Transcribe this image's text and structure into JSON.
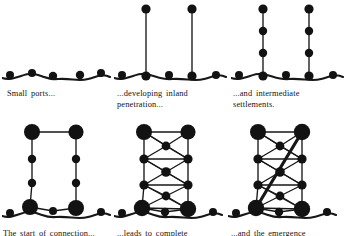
{
  "figure": {
    "stroke_color": "#171717",
    "node_color": "#121212",
    "background": "#ffffff"
  },
  "panels": [
    {
      "id": "panel-1",
      "stage": 1,
      "caption": "Small  ports...",
      "description": "scattered coastal ports along a wavy coastline",
      "nodes": [
        {
          "x": 8,
          "y": 19,
          "r": 4.0,
          "kind": "port"
        },
        {
          "x": 30,
          "y": 17,
          "r": 4.0,
          "kind": "port"
        },
        {
          "x": 51,
          "y": 20,
          "r": 4.2,
          "kind": "port"
        },
        {
          "x": 78,
          "y": 19,
          "r": 4.2,
          "kind": "port"
        },
        {
          "x": 99,
          "y": 17,
          "r": 4.0,
          "kind": "port"
        }
      ],
      "coastline": "M 0,22 C 12,26 22,16 32,18 C 42,20 46,24 56,23 C 70,22 76,26 86,23 C 94,21 100,17 108,21"
    },
    {
      "id": "panel-2",
      "stage": 2,
      "caption": "...developing  inland\npenetration...",
      "description": "two inland penetration lines from two ports",
      "nodes": [
        {
          "x": 8,
          "y": 73,
          "r": 4.0,
          "kind": "port"
        },
        {
          "x": 32,
          "y": 74,
          "r": 4.6,
          "kind": "port-hub"
        },
        {
          "x": 55,
          "y": 73,
          "r": 4.0,
          "kind": "port"
        },
        {
          "x": 78,
          "y": 74,
          "r": 4.6,
          "kind": "port-hub"
        },
        {
          "x": 102,
          "y": 73,
          "r": 4.0,
          "kind": "port"
        },
        {
          "x": 32,
          "y": 7,
          "r": 4.6,
          "kind": "interior"
        },
        {
          "x": 78,
          "y": 7,
          "r": 4.6,
          "kind": "interior"
        }
      ],
      "links": [
        [
          1,
          5
        ],
        [
          3,
          6
        ]
      ],
      "coastline": "M 0,76 C 12,80 22,70 32,72 C 42,74 48,78 58,77 C 72,76 80,80 90,77 C 98,75 104,71 112,75"
    },
    {
      "id": "panel-3",
      "stage": 3,
      "caption": "...and  intermediate\nsettlements.",
      "description": "intermediate settlements appear along the penetration lines",
      "nodes": [
        {
          "x": 8,
          "y": 73,
          "r": 4.0,
          "kind": "port"
        },
        {
          "x": 32,
          "y": 74,
          "r": 4.6,
          "kind": "port-hub"
        },
        {
          "x": 55,
          "y": 73,
          "r": 4.0,
          "kind": "port"
        },
        {
          "x": 78,
          "y": 74,
          "r": 4.6,
          "kind": "port-hub"
        },
        {
          "x": 102,
          "y": 73,
          "r": 4.0,
          "kind": "port"
        },
        {
          "x": 32,
          "y": 7,
          "r": 4.6,
          "kind": "interior"
        },
        {
          "x": 78,
          "y": 7,
          "r": 4.6,
          "kind": "interior"
        },
        {
          "x": 32,
          "y": 29,
          "r": 4.2,
          "kind": "intermediate"
        },
        {
          "x": 32,
          "y": 51,
          "r": 4.2,
          "kind": "intermediate"
        },
        {
          "x": 78,
          "y": 29,
          "r": 4.2,
          "kind": "intermediate"
        },
        {
          "x": 78,
          "y": 51,
          "r": 4.2,
          "kind": "intermediate"
        }
      ],
      "links": [
        [
          1,
          8
        ],
        [
          8,
          7
        ],
        [
          7,
          5
        ],
        [
          3,
          10
        ],
        [
          10,
          9
        ],
        [
          9,
          6
        ]
      ],
      "coastline": "M 0,76 C 12,80 22,70 32,72 C 42,74 48,78 58,77 C 72,76 80,80 90,77 C 98,75 104,71 112,75"
    },
    {
      "id": "panel-4",
      "stage": 4,
      "caption": "The  start  of  connection...",
      "description": "feeder route connections begin; main ports and interior centres enlarge",
      "nodes": [
        {
          "x": 30,
          "y": 12,
          "r": 8.0,
          "kind": "major-interior"
        },
        {
          "x": 74,
          "y": 12,
          "r": 7.6,
          "kind": "major-interior"
        },
        {
          "x": 30,
          "y": 39,
          "r": 4.2,
          "kind": "intermediate"
        },
        {
          "x": 74,
          "y": 39,
          "r": 4.2,
          "kind": "intermediate"
        },
        {
          "x": 30,
          "y": 63,
          "r": 4.2,
          "kind": "intermediate"
        },
        {
          "x": 74,
          "y": 63,
          "r": 4.2,
          "kind": "intermediate"
        },
        {
          "x": 28,
          "y": 87,
          "r": 8.0,
          "kind": "major-port"
        },
        {
          "x": 74,
          "y": 88,
          "r": 8.0,
          "kind": "major-port"
        },
        {
          "x": 51,
          "y": 91,
          "r": 4.0,
          "kind": "port"
        },
        {
          "x": 8,
          "y": 93,
          "r": 4.0,
          "kind": "port"
        },
        {
          "x": 99,
          "y": 92,
          "r": 4.0,
          "kind": "port"
        }
      ],
      "links": [
        [
          0,
          1
        ],
        [
          0,
          2
        ],
        [
          2,
          4
        ],
        [
          4,
          6
        ],
        [
          1,
          3
        ],
        [
          3,
          5
        ],
        [
          5,
          7
        ],
        [
          6,
          8
        ],
        [
          8,
          7
        ]
      ],
      "coastline": "M 0,96 C 12,100 20,90 30,92 C 40,94 44,98 54,97 C 68,96 76,100 86,97 C 94,95 100,91 108,95"
    },
    {
      "id": "panel-5",
      "stage": 5,
      "caption": "...leads to complete\ninterconnection...",
      "description": "lateral and diagonal interconnections form a lattice",
      "nodes": [
        {
          "x": 30,
          "y": 12,
          "r": 8.0,
          "kind": "major-interior"
        },
        {
          "x": 74,
          "y": 12,
          "r": 7.6,
          "kind": "major-interior"
        },
        {
          "x": 52,
          "y": 26,
          "r": 4.4,
          "kind": "intermediate"
        },
        {
          "x": 30,
          "y": 39,
          "r": 4.6,
          "kind": "intermediate"
        },
        {
          "x": 74,
          "y": 39,
          "r": 4.6,
          "kind": "intermediate"
        },
        {
          "x": 52,
          "y": 52,
          "r": 4.8,
          "kind": "intermediate"
        },
        {
          "x": 30,
          "y": 65,
          "r": 4.6,
          "kind": "intermediate"
        },
        {
          "x": 74,
          "y": 65,
          "r": 4.6,
          "kind": "intermediate"
        },
        {
          "x": 52,
          "y": 76,
          "r": 4.4,
          "kind": "intermediate"
        },
        {
          "x": 28,
          "y": 88,
          "r": 8.2,
          "kind": "major-port"
        },
        {
          "x": 74,
          "y": 89,
          "r": 8.2,
          "kind": "major-port"
        },
        {
          "x": 51,
          "y": 92,
          "r": 4.2,
          "kind": "port"
        },
        {
          "x": 8,
          "y": 93,
          "r": 4.0,
          "kind": "port"
        },
        {
          "x": 99,
          "y": 92,
          "r": 4.0,
          "kind": "port"
        }
      ],
      "links": [
        [
          0,
          1
        ],
        [
          0,
          3
        ],
        [
          3,
          6
        ],
        [
          6,
          9
        ],
        [
          1,
          4
        ],
        [
          4,
          7
        ],
        [
          7,
          10
        ],
        [
          9,
          11
        ],
        [
          11,
          10
        ],
        [
          0,
          2
        ],
        [
          2,
          1
        ],
        [
          0,
          4
        ],
        [
          3,
          2
        ],
        [
          2,
          4
        ],
        [
          3,
          5
        ],
        [
          5,
          4
        ],
        [
          3,
          7
        ],
        [
          6,
          5
        ],
        [
          5,
          7
        ],
        [
          6,
          8
        ],
        [
          8,
          7
        ],
        [
          6,
          10
        ],
        [
          9,
          8
        ],
        [
          8,
          10
        ],
        [
          3,
          4
        ],
        [
          6,
          7
        ],
        [
          9,
          10
        ]
      ],
      "coastline": "M 0,96 C 12,100 20,90 30,92 C 40,94 44,98 54,97 C 68,96 76,100 86,97 C 94,95 100,91 108,95"
    },
    {
      "id": "panel-6",
      "stage": 6,
      "caption": "...and  the  emergence  of\nmain  street  routes.",
      "description": "a high-priority main street trunk route emerges across the network",
      "nodes": [
        {
          "x": 30,
          "y": 12,
          "r": 8.0,
          "kind": "major-interior"
        },
        {
          "x": 74,
          "y": 12,
          "r": 8.2,
          "kind": "major-interior"
        },
        {
          "x": 52,
          "y": 26,
          "r": 4.4,
          "kind": "intermediate"
        },
        {
          "x": 30,
          "y": 39,
          "r": 4.6,
          "kind": "intermediate"
        },
        {
          "x": 74,
          "y": 39,
          "r": 4.6,
          "kind": "intermediate"
        },
        {
          "x": 52,
          "y": 52,
          "r": 4.8,
          "kind": "intermediate"
        },
        {
          "x": 30,
          "y": 65,
          "r": 4.6,
          "kind": "intermediate"
        },
        {
          "x": 74,
          "y": 65,
          "r": 4.6,
          "kind": "intermediate"
        },
        {
          "x": 52,
          "y": 76,
          "r": 4.4,
          "kind": "intermediate"
        },
        {
          "x": 28,
          "y": 88,
          "r": 8.2,
          "kind": "major-port"
        },
        {
          "x": 74,
          "y": 89,
          "r": 8.2,
          "kind": "major-port"
        },
        {
          "x": 51,
          "y": 92,
          "r": 4.2,
          "kind": "port"
        },
        {
          "x": 8,
          "y": 93,
          "r": 4.0,
          "kind": "port"
        },
        {
          "x": 99,
          "y": 92,
          "r": 4.0,
          "kind": "port"
        }
      ],
      "links": [
        [
          0,
          1
        ],
        [
          0,
          3
        ],
        [
          3,
          6
        ],
        [
          6,
          9
        ],
        [
          1,
          4
        ],
        [
          4,
          7
        ],
        [
          7,
          10
        ],
        [
          9,
          11
        ],
        [
          11,
          10
        ],
        [
          0,
          2
        ],
        [
          2,
          1
        ],
        [
          0,
          4
        ],
        [
          3,
          2
        ],
        [
          2,
          4
        ],
        [
          3,
          5
        ],
        [
          5,
          4
        ],
        [
          3,
          7
        ],
        [
          6,
          5
        ],
        [
          5,
          7
        ],
        [
          6,
          8
        ],
        [
          8,
          7
        ],
        [
          6,
          10
        ],
        [
          9,
          8
        ],
        [
          8,
          10
        ],
        [
          3,
          4
        ],
        [
          6,
          7
        ],
        [
          9,
          10
        ]
      ],
      "main_street": {
        "from": 9,
        "to": 1,
        "width": 3.2,
        "label": "main street"
      },
      "coastline": "M 0,96 C 12,100 20,90 30,92 C 40,94 44,98 54,97 C 68,96 76,100 86,97 C 94,95 100,91 108,95"
    }
  ],
  "captions": {
    "c1": "Small  ports...",
    "c2": "...developing  inland\npenetration...",
    "c3": "...and  intermediate\nsettlements.",
    "c4": "The  start  of  connection...",
    "c5": "...leads  to  complete\ninterconnection...",
    "c6": "...and  the  emergence\nof  main  street  routes."
  }
}
